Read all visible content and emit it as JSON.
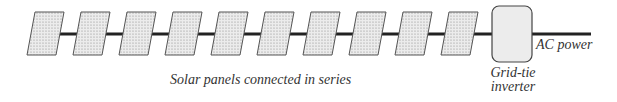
{
  "diagram": {
    "panel_count": 10,
    "labels": {
      "series": "Solar panels connected in series",
      "ac_power": "AC power",
      "inverter_line1": "Grid-tie",
      "inverter_line2": "inverter"
    },
    "colors": {
      "wire": "#222222",
      "panel_fill": "#e6e6e6",
      "panel_stroke": "#555555",
      "inverter_fill": "#ececec"
    }
  }
}
